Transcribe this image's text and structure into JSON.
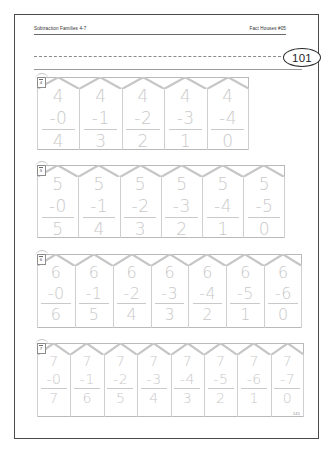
{
  "page": {
    "header_left": "Subtraction Families 4-7",
    "header_right": "Fact Houses #05",
    "page_number": "101",
    "footer_number": "145"
  },
  "rows": [
    {
      "family": "4",
      "badge_label": "4",
      "problems": [
        {
          "minuend": "4",
          "operator": "-",
          "subtrahend": "0",
          "answer": "4"
        },
        {
          "minuend": "4",
          "operator": "-",
          "subtrahend": "1",
          "answer": "3"
        },
        {
          "minuend": "4",
          "operator": "-",
          "subtrahend": "2",
          "answer": "2"
        },
        {
          "minuend": "4",
          "operator": "-",
          "subtrahend": "3",
          "answer": "1"
        },
        {
          "minuend": "4",
          "operator": "-",
          "subtrahend": "4",
          "answer": "0"
        }
      ]
    },
    {
      "family": "5",
      "badge_label": "5",
      "problems": [
        {
          "minuend": "5",
          "operator": "-",
          "subtrahend": "0",
          "answer": "5"
        },
        {
          "minuend": "5",
          "operator": "-",
          "subtrahend": "1",
          "answer": "4"
        },
        {
          "minuend": "5",
          "operator": "-",
          "subtrahend": "2",
          "answer": "3"
        },
        {
          "minuend": "5",
          "operator": "-",
          "subtrahend": "3",
          "answer": "2"
        },
        {
          "minuend": "5",
          "operator": "-",
          "subtrahend": "4",
          "answer": "1"
        },
        {
          "minuend": "5",
          "operator": "-",
          "subtrahend": "5",
          "answer": "0"
        }
      ]
    },
    {
      "family": "6",
      "badge_label": "6",
      "problems": [
        {
          "minuend": "6",
          "operator": "-",
          "subtrahend": "0",
          "answer": "6"
        },
        {
          "minuend": "6",
          "operator": "-",
          "subtrahend": "1",
          "answer": "5"
        },
        {
          "minuend": "6",
          "operator": "-",
          "subtrahend": "2",
          "answer": "4"
        },
        {
          "minuend": "6",
          "operator": "-",
          "subtrahend": "3",
          "answer": "3"
        },
        {
          "minuend": "6",
          "operator": "-",
          "subtrahend": "4",
          "answer": "2"
        },
        {
          "minuend": "6",
          "operator": "-",
          "subtrahend": "5",
          "answer": "1"
        },
        {
          "minuend": "6",
          "operator": "-",
          "subtrahend": "6",
          "answer": "0"
        }
      ]
    },
    {
      "family": "7",
      "badge_label": "7",
      "problems": [
        {
          "minuend": "7",
          "operator": "-",
          "subtrahend": "0",
          "answer": "7"
        },
        {
          "minuend": "7",
          "operator": "-",
          "subtrahend": "1",
          "answer": "6"
        },
        {
          "minuend": "7",
          "operator": "-",
          "subtrahend": "2",
          "answer": "5"
        },
        {
          "minuend": "7",
          "operator": "-",
          "subtrahend": "3",
          "answer": "4"
        },
        {
          "minuend": "7",
          "operator": "-",
          "subtrahend": "4",
          "answer": "3"
        },
        {
          "minuend": "7",
          "operator": "-",
          "subtrahend": "5",
          "answer": "2"
        },
        {
          "minuend": "7",
          "operator": "-",
          "subtrahend": "6",
          "answer": "1"
        },
        {
          "minuend": "7",
          "operator": "-",
          "subtrahend": "7",
          "answer": "0"
        }
      ]
    }
  ],
  "colors": {
    "digit_gray": "#c9c9c9",
    "line_gray": "#b9b9b9",
    "ink_dark": "#2b2b2b"
  }
}
